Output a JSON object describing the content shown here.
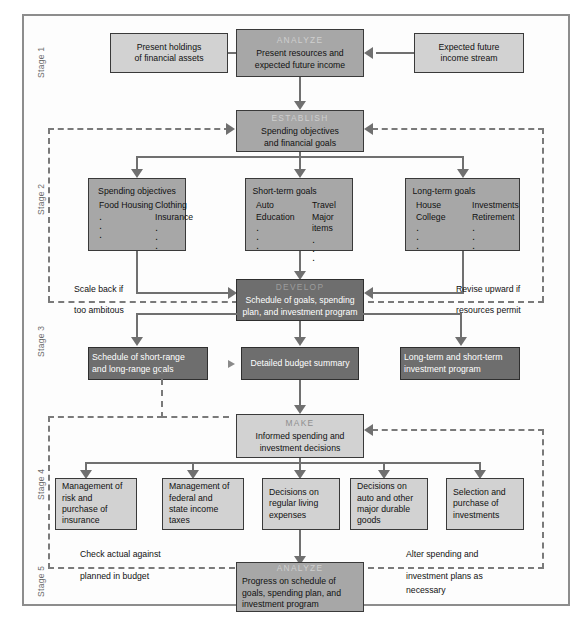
{
  "figure": {
    "colors": {
      "box_light": "#d2d2d2",
      "box_mid": "#a7a7a7",
      "box_dark": "#6e6e6e",
      "connector": "#707070",
      "frame": "#8d8d8d"
    }
  },
  "stages": [
    {
      "label": "Stage 1"
    },
    {
      "label": "Stage 2"
    },
    {
      "label": "Stage 3"
    },
    {
      "label": "Stage 4"
    },
    {
      "label": "Stage 5"
    }
  ],
  "stage1": {
    "left_box": {
      "lines": [
        "Present holdings",
        "of financial assets"
      ]
    },
    "center_box": {
      "head": "ANALYZE",
      "lines": [
        "Present resources and",
        "expected future income"
      ]
    },
    "right_box": {
      "lines": [
        "Expected future",
        "income stream"
      ]
    }
  },
  "stage2": {
    "establish": {
      "head": "ESTABLISH",
      "lines": [
        "Spending objectives",
        "and financial goals"
      ]
    },
    "spending_objectives": {
      "title": "Spending objectives",
      "col1": [
        "Food",
        "Housing"
      ],
      "col2": [
        "Clothing",
        "Insurance"
      ]
    },
    "short_term_goals": {
      "title": "Short-term goals",
      "col1": [
        "Auto",
        "Education"
      ],
      "col2": [
        "Travel",
        "Major items"
      ]
    },
    "long_term_goals": {
      "title": "Long-term goals",
      "col1": [
        "House",
        "College"
      ],
      "col2": [
        "Investments",
        "Retirement"
      ]
    }
  },
  "stage3": {
    "develop": {
      "head": "DEVELOP",
      "lines": [
        "Schedule of goals, spending",
        "plan, and investment program"
      ]
    },
    "schedule_box": {
      "lines": [
        "Schedule of short-range",
        "and long-range goals"
      ]
    },
    "budget_box": {
      "lines": [
        "Detailed budget summary"
      ]
    },
    "investment_box": {
      "lines": [
        "Long-term and short-term",
        "investment program"
      ]
    },
    "feedback_left": {
      "lines": [
        "Scale back if",
        "too ambitous"
      ]
    },
    "feedback_right": {
      "lines": [
        "Revise upward if",
        "resources permit"
      ]
    }
  },
  "stage4": {
    "make": {
      "head": "MAKE",
      "lines": [
        "Informed spending and",
        "investment decisions"
      ]
    },
    "items": [
      {
        "lines": [
          "Management of",
          "risk and",
          "purchase of",
          "insurance"
        ]
      },
      {
        "lines": [
          "Management of",
          "federal and",
          "state income",
          "taxes"
        ]
      },
      {
        "lines": [
          "Decisions on",
          "regular living",
          "expenses"
        ]
      },
      {
        "lines": [
          "Decisions on",
          "auto and other",
          "major durable",
          "goods"
        ]
      },
      {
        "lines": [
          "Selection and",
          "purchase of",
          "investments"
        ]
      }
    ]
  },
  "stage5": {
    "analyze": {
      "head": "ANALYZE",
      "lines": [
        "Progress on schedule of",
        "goals, spending plan, and",
        "investment program"
      ]
    },
    "feedback_left": {
      "lines": [
        "Check actual against",
        "planned in budget"
      ]
    },
    "feedback_right": {
      "lines": [
        "Alter spending and",
        "investment plans as",
        "necessary"
      ]
    }
  }
}
